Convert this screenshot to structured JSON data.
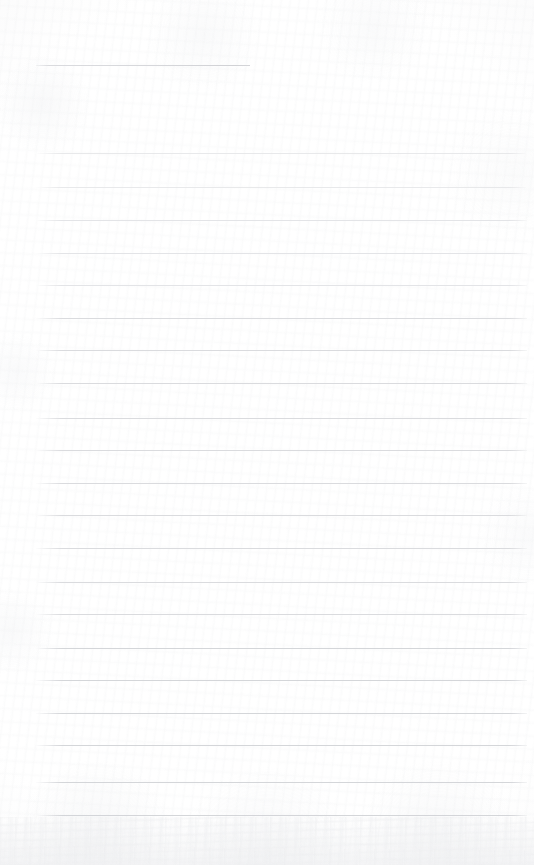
{
  "page": {
    "kind": "lined-paper-scan",
    "width": 534,
    "height": 865,
    "background_color": "#fdfdfd",
    "has_visible_text": false,
    "has_handwriting": false,
    "margin_rule": false
  },
  "rules": {
    "line_color": "#d9dadd",
    "line_color_faint": "#e2e3e6",
    "line_color_strong": "#d2d4d8",
    "line_thickness": 1,
    "left_x": 36,
    "right_x": 526,
    "spacing": 33,
    "full_width_count": 21,
    "headline": {
      "label": "headline-rule",
      "y": 65,
      "x_start": 36,
      "x_end": 250,
      "width": 214
    },
    "lines": [
      {
        "y": 153,
        "x_start": 36,
        "x_end": 526,
        "weight": "fainter"
      },
      {
        "y": 187,
        "x_start": 36,
        "x_end": 526,
        "weight": "fainter"
      },
      {
        "y": 220,
        "x_start": 36,
        "x_end": 527,
        "weight": "faint"
      },
      {
        "y": 253,
        "x_start": 36,
        "x_end": 527,
        "weight": "faint"
      },
      {
        "y": 285,
        "x_start": 36,
        "x_end": 527,
        "weight": "faint"
      },
      {
        "y": 318,
        "x_start": 36,
        "x_end": 527,
        "weight": "normal"
      },
      {
        "y": 350,
        "x_start": 36,
        "x_end": 527,
        "weight": "normal"
      },
      {
        "y": 383,
        "x_start": 36,
        "x_end": 527,
        "weight": "normal"
      },
      {
        "y": 418,
        "x_start": 36,
        "x_end": 527,
        "weight": "normal"
      },
      {
        "y": 450,
        "x_start": 36,
        "x_end": 527,
        "weight": "normal"
      },
      {
        "y": 483,
        "x_start": 36,
        "x_end": 527,
        "weight": "normal"
      },
      {
        "y": 515,
        "x_start": 36,
        "x_end": 527,
        "weight": "normal"
      },
      {
        "y": 548,
        "x_start": 36,
        "x_end": 527,
        "weight": "normal"
      },
      {
        "y": 582,
        "x_start": 36,
        "x_end": 527,
        "weight": "normal"
      },
      {
        "y": 614,
        "x_start": 36,
        "x_end": 527,
        "weight": "normal"
      },
      {
        "y": 648,
        "x_start": 36,
        "x_end": 527,
        "weight": "strong"
      },
      {
        "y": 680,
        "x_start": 36,
        "x_end": 527,
        "weight": "strong"
      },
      {
        "y": 713,
        "x_start": 36,
        "x_end": 527,
        "weight": "strong"
      },
      {
        "y": 745,
        "x_start": 36,
        "x_end": 527,
        "weight": "strong"
      },
      {
        "y": 782,
        "x_start": 36,
        "x_end": 527,
        "weight": "strong"
      },
      {
        "y": 815,
        "x_start": 36,
        "x_end": 527,
        "weight": "strong"
      }
    ]
  },
  "texture": {
    "edge_vignette": true,
    "bottom_mottle": true,
    "grain": "paper-fibre"
  }
}
